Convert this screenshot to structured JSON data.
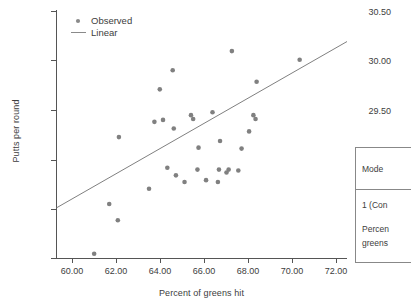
{
  "chart_data": {
    "type": "scatter",
    "title": "",
    "xlabel": "Percent of greens hit",
    "ylabel": "Putts per round",
    "xlim": [
      59.0,
      72.5
    ],
    "ylim": [
      28.0,
      30.6
    ],
    "xticks": [
      "60.00",
      "62.00",
      "64.00",
      "66.00",
      "68.00",
      "70.00",
      "72.00"
    ],
    "xtick_values": [
      60.0,
      62.0,
      64.0,
      66.0,
      68.0,
      70.0,
      72.0
    ],
    "yticks": [
      "28.00",
      "28.50",
      "29.00",
      "29.50",
      "30.00",
      "30.50"
    ],
    "ytick_values": [
      28.0,
      28.5,
      29.0,
      29.5,
      30.0,
      30.5
    ],
    "grid": false,
    "legend_position": "upper left",
    "legend": [
      {
        "label": "Observed",
        "marker": "dot",
        "color": "#808080"
      },
      {
        "label": "Linear",
        "marker": "line",
        "color": "#808080"
      }
    ],
    "series": [
      {
        "name": "Observed",
        "type": "scatter",
        "color": "#808080",
        "points": [
          [
            60.75,
            28.05
          ],
          [
            61.45,
            28.57
          ],
          [
            61.85,
            28.4
          ],
          [
            61.9,
            29.27
          ],
          [
            63.3,
            28.73
          ],
          [
            63.55,
            29.43
          ],
          [
            63.8,
            29.77
          ],
          [
            63.95,
            29.45
          ],
          [
            64.15,
            28.95
          ],
          [
            64.4,
            29.97
          ],
          [
            64.45,
            29.36
          ],
          [
            64.55,
            28.87
          ],
          [
            64.95,
            28.8
          ],
          [
            65.25,
            29.5
          ],
          [
            65.35,
            29.46
          ],
          [
            65.55,
            28.93
          ],
          [
            65.6,
            29.16
          ],
          [
            65.95,
            28.82
          ],
          [
            66.25,
            29.53
          ],
          [
            66.5,
            28.8
          ],
          [
            66.55,
            28.93
          ],
          [
            66.6,
            29.23
          ],
          [
            66.9,
            28.9
          ],
          [
            67.0,
            28.93
          ],
          [
            67.15,
            30.17
          ],
          [
            67.45,
            28.92
          ],
          [
            67.6,
            29.15
          ],
          [
            67.95,
            29.33
          ],
          [
            68.15,
            29.5
          ],
          [
            68.25,
            29.46
          ],
          [
            68.3,
            29.85
          ],
          [
            70.3,
            30.08
          ]
        ]
      },
      {
        "name": "Linear",
        "type": "line",
        "color": "#808080",
        "endpoints": [
          [
            59.0,
            28.53
          ],
          [
            72.5,
            30.27
          ]
        ]
      }
    ]
  },
  "side_table": {
    "header": "Mode",
    "rows": [
      "1 (Con",
      "Percen",
      "greens"
    ]
  }
}
